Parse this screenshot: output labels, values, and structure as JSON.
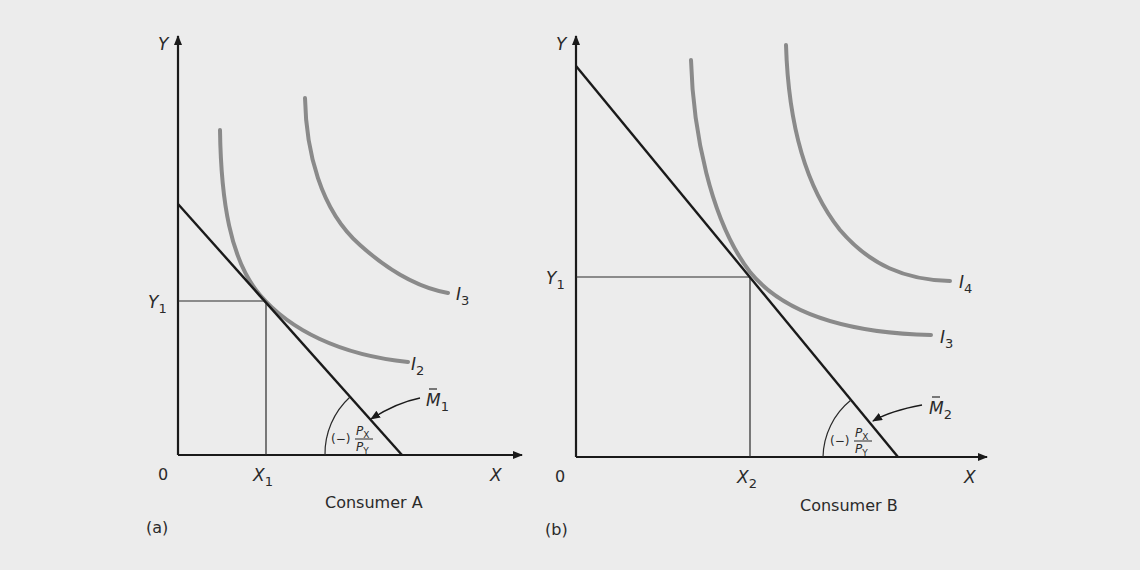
{
  "panels": [
    {
      "id": "a",
      "panel_label": "(a)",
      "caption": "Consumer A",
      "axis": {
        "x_label": "X",
        "y_label": "Y",
        "origin_label": "0"
      },
      "x_tick": {
        "base": "X",
        "sub": "1"
      },
      "y_tick": {
        "base": "Y",
        "sub": "1"
      },
      "budget_line": {
        "base": "M",
        "sub": "1",
        "accent": "̄"
      },
      "slope": {
        "sign": "(−)",
        "num": "P",
        "num_sub": "X",
        "den": "P",
        "den_sub": "Y"
      },
      "curves": [
        {
          "base": "I",
          "sub": "2"
        },
        {
          "base": "I",
          "sub": "3"
        }
      ]
    },
    {
      "id": "b",
      "panel_label": "(b)",
      "caption": "Consumer B",
      "axis": {
        "x_label": "X",
        "y_label": "Y",
        "origin_label": "0"
      },
      "x_tick": {
        "base": "X",
        "sub": "2"
      },
      "y_tick": {
        "base": "Y",
        "sub": "1"
      },
      "budget_line": {
        "base": "M",
        "sub": "2",
        "accent": "̄"
      },
      "slope": {
        "sign": "(−)",
        "num": "P",
        "num_sub": "X",
        "den": "P",
        "den_sub": "Y"
      },
      "curves": [
        {
          "base": "I",
          "sub": "3"
        },
        {
          "base": "I",
          "sub": "4"
        }
      ]
    }
  ],
  "colors": {
    "background": "#ececec",
    "axis": "#1a1a1a",
    "indifference_curve": "#8a8a8a",
    "text": "#2a2a2a"
  }
}
